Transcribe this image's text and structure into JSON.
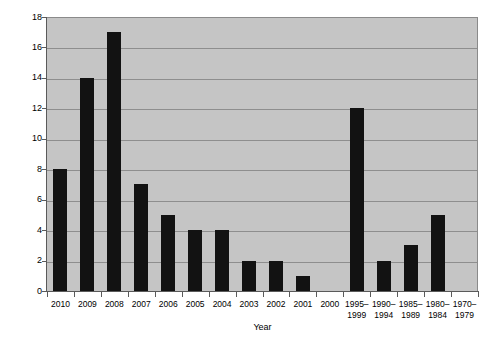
{
  "chart_data": {
    "type": "bar",
    "title": "",
    "xlabel": "Year",
    "ylabel": "Number of references",
    "categories": [
      "2010",
      "2009",
      "2008",
      "2007",
      "2006",
      "2005",
      "2004",
      "2003",
      "2002",
      "2001",
      "2000",
      "1995–1999",
      "1990–1994",
      "1985–1989",
      "1980–1984",
      "1970–1979"
    ],
    "values": [
      8,
      14,
      17,
      7,
      5,
      4,
      4,
      2,
      2,
      1,
      0,
      12,
      2,
      3,
      5,
      0
    ],
    "ylim": [
      0,
      18
    ],
    "ytick_labels": [
      "0",
      "2",
      "4",
      "6",
      "8",
      "10",
      "12",
      "14",
      "16",
      "18"
    ],
    "ytick_values": [
      0,
      2,
      4,
      6,
      8,
      10,
      12,
      14,
      16,
      18
    ],
    "grid": "horizontal",
    "legend": "none",
    "bar_color": "#121212",
    "plot_background": "#c5c5c5",
    "gridline_color": "#8e8e8e",
    "axis_color": "#5a5a5a",
    "figure_background": "#ffffff"
  }
}
